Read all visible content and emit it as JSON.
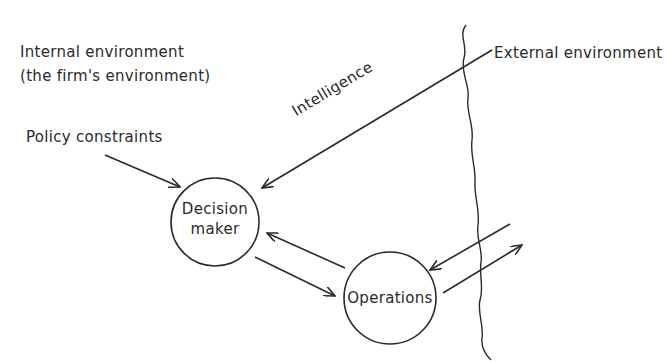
{
  "diagram": {
    "labels": {
      "internal_line1": "Internal environment",
      "internal_line2": "(the firm's environment)",
      "external": "External environment",
      "policy": "Policy constraints",
      "intelligence": "Intelligence"
    },
    "nodes": {
      "decision_maker": {
        "line1": "Decision",
        "line2": "maker"
      },
      "operations": {
        "label": "Operations"
      }
    },
    "edges": [
      {
        "from": "Policy constraints",
        "to": "Decision maker"
      },
      {
        "from": "External environment",
        "to": "Decision maker",
        "label": "Intelligence"
      },
      {
        "from": "Decision maker",
        "to": "Operations"
      },
      {
        "from": "Operations",
        "to": "Decision maker"
      },
      {
        "from": "External environment",
        "to": "Operations"
      },
      {
        "from": "Operations",
        "to": "External environment"
      }
    ],
    "colors": {
      "ink": "#2a2a2a",
      "background": "#ffffff"
    }
  }
}
